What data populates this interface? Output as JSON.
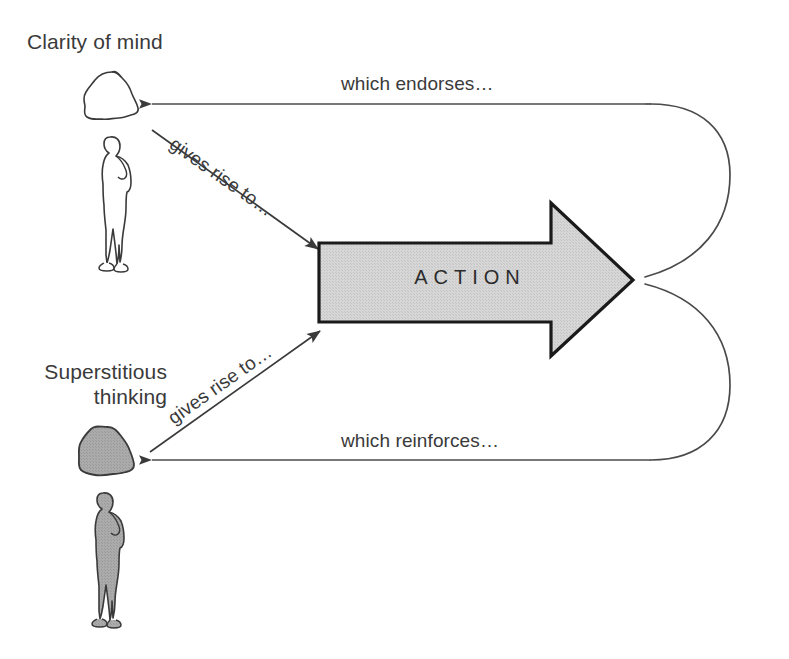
{
  "diagram": {
    "canvas": {
      "width": 789,
      "height": 659,
      "background": "#ffffff"
    },
    "nodes": {
      "clarity": {
        "label": "Clarity of mind",
        "blob_icon": "clear-mind-blob-icon",
        "person_icon": "standing-person-outline-icon",
        "fill": "#ffffff",
        "stroke": "#3a3a3a"
      },
      "superstitious": {
        "label_line_1": "Superstitious",
        "label_line_2": "thinking",
        "blob_icon": "clouded-mind-blob-icon",
        "person_icon": "standing-person-filled-icon",
        "fill": "#a8a8a8",
        "stroke": "#3a3a3a"
      },
      "action": {
        "label": "ACTION",
        "shape": "right-arrow-block",
        "fill": "#d4d4d4",
        "stroke": "#1a1a1a"
      }
    },
    "edges": {
      "gives_rise_to_top": {
        "label": "gives rise to…",
        "from": "clarity",
        "to": "action",
        "direction": "down-right"
      },
      "gives_rise_to_bottom": {
        "label": "gives rise to…",
        "from": "superstitious",
        "to": "action",
        "direction": "up-right"
      },
      "which_endorses": {
        "label": "which endorses…",
        "from": "action",
        "to": "clarity",
        "direction": "loop-left-top"
      },
      "which_reinforces": {
        "label": "which reinforces…",
        "from": "action",
        "to": "superstitious",
        "direction": "loop-left-bottom"
      }
    },
    "colors": {
      "ink": "#3a3a3a",
      "line": "#4a4a4a",
      "arrow_fill": "#d4d4d4",
      "arrow_stroke": "#1a1a1a",
      "figure_gray": "#a8a8a8",
      "background": "#ffffff"
    }
  }
}
